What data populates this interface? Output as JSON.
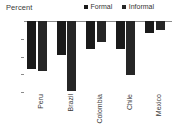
{
  "chart_data": {
    "type": "bar",
    "title": "",
    "ylabel": "Percent",
    "xlabel": "",
    "categories": [
      "Peru",
      "Brazil",
      "Colombia",
      "Chile",
      "Mexico"
    ],
    "series": [
      {
        "name": "Formal",
        "values": [
          -13.5,
          -9.5,
          -8.0,
          -7.8,
          -3.5
        ],
        "color": "#1a1a1a"
      },
      {
        "name": "Informal",
        "values": [
          -14.0,
          -19.7,
          -6.0,
          -15.2,
          -2.5
        ],
        "color": "#262626"
      }
    ],
    "ylim": [
      -20,
      0
    ],
    "yticks": [
      0,
      -5,
      -10,
      -15,
      -20
    ],
    "ytick_labels": [
      "0",
      "-5",
      "-10",
      "-15",
      "-20"
    ],
    "grid": false,
    "legend_position": "top-right"
  },
  "axis": {
    "percent_label": "Percent"
  },
  "legend": {
    "items": [
      {
        "label": "Formal",
        "color": "#1a1a1a"
      },
      {
        "label": "Informal",
        "color": "#262626"
      }
    ]
  }
}
